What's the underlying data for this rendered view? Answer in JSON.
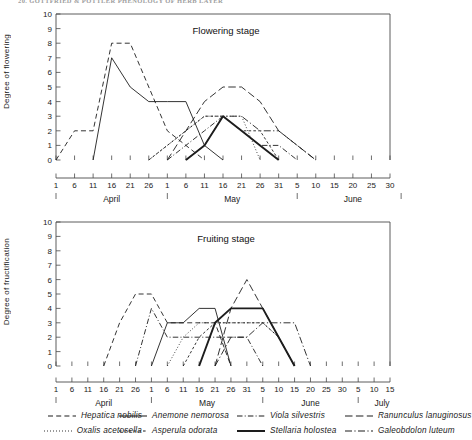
{
  "running_head": "20. GOTTFRIED & POTTLER PHENOLOGY OF HERB LAYER",
  "axes": {
    "top_y_label": "Degree of flowering",
    "bottom_y_label": "Degree of fructification",
    "y_ticks": [
      "0",
      "1",
      "2",
      "3",
      "4",
      "5",
      "6",
      "7",
      "8",
      "9",
      "10"
    ]
  },
  "charts": [
    {
      "id": "flowering",
      "title": "Flowering stage",
      "ylabel": "Degree of flowering",
      "ylim": [
        0,
        10
      ],
      "day_ticks": [
        "1",
        "6",
        "11",
        "16",
        "21",
        "26",
        "1",
        "6",
        "11",
        "16",
        "21",
        "26",
        "31",
        "5",
        "10",
        "15",
        "20",
        "25",
        "30"
      ],
      "month_labels": [
        "April",
        "May",
        "June"
      ]
    },
    {
      "id": "fruiting",
      "title": "Fruiting stage",
      "ylabel": "Degree of fructification",
      "ylim": [
        0,
        10
      ],
      "day_ticks": [
        "1",
        "6",
        "11",
        "16",
        "21",
        "26",
        "1",
        "6",
        "11",
        "16",
        "21",
        "26",
        "31",
        "5",
        "10",
        "15",
        "20",
        "25",
        "30",
        "5",
        "10",
        "15"
      ],
      "month_labels": [
        "April",
        "May",
        "June",
        "July"
      ]
    }
  ],
  "legend": {
    "columns": [
      {
        "items": [
          {
            "name": "Hepatica nobilis",
            "style": "dashed"
          },
          {
            "name": "Oxalis acetosella",
            "style": "dotted"
          }
        ]
      },
      {
        "items": [
          {
            "name": "Anemone nemorosa",
            "style": "solid-thin"
          },
          {
            "name": "Asperula odorata",
            "style": "short-dash"
          }
        ]
      },
      {
        "items": [
          {
            "name": "Viola silvestris",
            "style": "dash-dot"
          },
          {
            "name": "Stellaria holostea",
            "style": "solid-thick"
          }
        ]
      },
      {
        "items": [
          {
            "name": "Ranunculus lanuginosus",
            "style": "long-dash"
          },
          {
            "name": "Galeobdolon luteum",
            "style": "dash-dot-long"
          }
        ]
      }
    ]
  },
  "chart_data": [
    {
      "type": "line",
      "title": "Flowering stage",
      "xlabel": "",
      "ylabel": "Degree of flowering",
      "ylim": [
        0,
        10
      ],
      "grid": false,
      "legend_position": "below-figure",
      "x_tick_labels": [
        "1",
        "6",
        "11",
        "16",
        "21",
        "26",
        "1",
        "6",
        "11",
        "16",
        "21",
        "26",
        "31",
        "5",
        "10",
        "15",
        "20",
        "25",
        "30"
      ],
      "x_month_groups": [
        "April",
        "May",
        "June"
      ],
      "x_unit": "date (5-day steps, April 1 - June 30)",
      "series": [
        {
          "name": "Hepatica nobilis",
          "style": "dashed",
          "x": [
            "Apr 1",
            "Apr 6",
            "Apr 11",
            "Apr 16",
            "Apr 21",
            "Apr 26",
            "May 1",
            "May 6",
            "May 11"
          ],
          "values": [
            0,
            2,
            2,
            8,
            8,
            5,
            2,
            1,
            0
          ]
        },
        {
          "name": "Anemone nemorosa",
          "style": "solid-thin",
          "x": [
            "Apr 11",
            "Apr 16",
            "Apr 21",
            "Apr 26",
            "May 1",
            "May 6",
            "May 11",
            "May 16"
          ],
          "values": [
            0,
            7,
            5,
            4,
            4,
            4,
            1,
            0
          ]
        },
        {
          "name": "Oxalis acetosella",
          "style": "dotted",
          "x": [
            "Apr 26",
            "May 1",
            "May 6",
            "May 11",
            "May 16",
            "May 21",
            "May 26"
          ],
          "values": [
            0,
            1,
            2,
            3,
            3,
            3,
            0
          ]
        },
        {
          "name": "Asperula odorata",
          "style": "short-dash",
          "x": [
            "Apr 26",
            "May 1",
            "May 6",
            "May 11",
            "May 16",
            "May 21",
            "May 26",
            "May 31"
          ],
          "values": [
            0,
            1,
            2,
            3,
            3,
            2,
            2,
            0
          ]
        },
        {
          "name": "Viola silvestris",
          "style": "dash-dot",
          "x": [
            "May 1",
            "May 6",
            "May 11",
            "May 16",
            "May 21",
            "May 26",
            "May 31",
            "Jun 5"
          ],
          "values": [
            0,
            1,
            2,
            3,
            2,
            1,
            1,
            0
          ]
        },
        {
          "name": "Stellaria holostea",
          "style": "solid-thick",
          "x": [
            "May 6",
            "May 11",
            "May 16",
            "May 21",
            "May 26",
            "May 31"
          ],
          "values": [
            0,
            1,
            3,
            2,
            1,
            0
          ]
        },
        {
          "name": "Ranunculus lanuginosus",
          "style": "long-dash",
          "x": [
            "May 1",
            "May 6",
            "May 11",
            "May 16",
            "May 21",
            "May 26",
            "May 31",
            "Jun 5",
            "Jun 10"
          ],
          "values": [
            0,
            2,
            4,
            5,
            5,
            4,
            2,
            1,
            0
          ]
        },
        {
          "name": "Galeobdolon luteum",
          "style": "dash-dot-long",
          "x": [
            "May 6",
            "May 11",
            "May 16",
            "May 21",
            "May 26",
            "May 31",
            "Jun 5",
            "Jun 10"
          ],
          "values": [
            0,
            1,
            3,
            3,
            2,
            2,
            1,
            0
          ]
        }
      ]
    },
    {
      "type": "line",
      "title": "Fruiting stage",
      "xlabel": "",
      "ylabel": "Degree of fructification",
      "ylim": [
        0,
        10
      ],
      "grid": false,
      "legend_position": "below-figure",
      "x_tick_labels": [
        "1",
        "6",
        "11",
        "16",
        "21",
        "26",
        "1",
        "6",
        "11",
        "16",
        "21",
        "26",
        "31",
        "5",
        "10",
        "15",
        "20",
        "25",
        "30",
        "5",
        "10",
        "15"
      ],
      "x_month_groups": [
        "April",
        "May",
        "June",
        "July"
      ],
      "x_unit": "date (5-day steps, April 1 - July 15)",
      "series": [
        {
          "name": "Hepatica nobilis",
          "style": "dashed",
          "x": [
            "Apr 16",
            "Apr 21",
            "Apr 26",
            "May 1",
            "May 6",
            "May 11",
            "May 16",
            "May 21",
            "May 26"
          ],
          "values": [
            0,
            3,
            5,
            5,
            3,
            3,
            3,
            3,
            0
          ]
        },
        {
          "name": "Anemone nemorosa",
          "style": "solid-thin",
          "x": [
            "May 1",
            "May 6",
            "May 11",
            "May 16",
            "May 21",
            "May 26"
          ],
          "values": [
            0,
            3,
            3,
            4,
            4,
            0
          ]
        },
        {
          "name": "Viola silvestris",
          "style": "dash-dot",
          "x": [
            "Apr 26",
            "May 1",
            "May 6",
            "May 11",
            "May 16",
            "May 21",
            "May 26",
            "May 31",
            "Jun 5"
          ],
          "values": [
            0,
            4,
            2,
            2,
            2,
            2,
            2,
            2,
            0
          ]
        },
        {
          "name": "Oxalis acetosella",
          "style": "dotted",
          "x": [
            "May 6",
            "May 11",
            "May 16",
            "May 21",
            "May 26",
            "May 31",
            "Jun 5",
            "Jun 10",
            "Jun 15"
          ],
          "values": [
            0,
            2,
            3,
            3,
            3,
            3,
            3,
            2,
            0
          ]
        },
        {
          "name": "Asperula odorata",
          "style": "short-dash",
          "x": [
            "May 11",
            "May 16",
            "May 21",
            "May 26",
            "May 31",
            "Jun 5",
            "Jun 10",
            "Jun 15"
          ],
          "values": [
            0,
            2,
            3,
            3,
            3,
            3,
            2,
            0
          ]
        },
        {
          "name": "Stellaria holostea",
          "style": "solid-thick",
          "x": [
            "May 16",
            "May 21",
            "May 26",
            "May 31",
            "Jun 5",
            "Jun 10",
            "Jun 15"
          ],
          "values": [
            0,
            3,
            4,
            4,
            4,
            2,
            0
          ]
        },
        {
          "name": "Ranunculus lanuginosus",
          "style": "long-dash",
          "x": [
            "May 21",
            "May 26",
            "May 31",
            "Jun 5",
            "Jun 10",
            "Jun 15"
          ],
          "values": [
            0,
            4,
            6,
            4,
            2,
            0
          ]
        },
        {
          "name": "Galeobdolon luteum",
          "style": "dash-dot-long",
          "x": [
            "May 21",
            "May 26",
            "May 31",
            "Jun 5",
            "Jun 10",
            "Jun 15",
            "Jun 20"
          ],
          "values": [
            0,
            2,
            2,
            3,
            3,
            3,
            0
          ]
        }
      ]
    }
  ]
}
